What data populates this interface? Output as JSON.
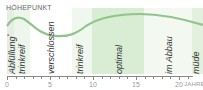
{
  "chart_data": {
    "type": "line",
    "title": "HÖHEPUNKT",
    "xlabel": "JAHRE",
    "ylabel": "",
    "x_ticks": [
      0,
      5,
      10,
      15,
      20
    ],
    "xlim": [
      0,
      22
    ],
    "grid": false,
    "legend": null,
    "series": [
      {
        "name": "Entwicklung",
        "x": [
          0,
          1,
          2,
          3,
          4,
          5,
          6,
          7,
          8,
          9,
          10,
          11,
          12,
          13,
          14,
          15,
          16,
          17,
          18,
          19,
          20,
          21,
          22
        ],
        "values": [
          0.55,
          0.72,
          0.7,
          0.55,
          0.42,
          0.35,
          0.35,
          0.38,
          0.5,
          0.62,
          0.72,
          0.8,
          0.85,
          0.88,
          0.9,
          0.9,
          0.88,
          0.85,
          0.8,
          0.75,
          0.7,
          0.66,
          0.62
        ]
      }
    ],
    "phases": [
      {
        "label": "Abfüllung",
        "sup": "*",
        "start": 0,
        "end": 1.2,
        "color": "#e8efe6"
      },
      {
        "label": "trinkreif",
        "start": 1.2,
        "end": 3,
        "color": "#f0f6ee"
      },
      {
        "label": "verschlossen",
        "start": 3,
        "end": 8,
        "color": "#ffffff"
      },
      {
        "label": "trinkreif",
        "start": 8,
        "end": 10,
        "color": "#f0f6ee"
      },
      {
        "label": "optimal",
        "start": 10,
        "end": 16,
        "color": "#d9eed5"
      },
      {
        "label": "im Abbau",
        "start": 16,
        "end": 21.5,
        "color": "#f2f8f0"
      },
      {
        "label": "müde",
        "start": 21.5,
        "end": 22.5,
        "color": "#e3f1de"
      }
    ],
    "colors": {
      "curve": "#8fc48a",
      "axis": "#888888"
    }
  }
}
